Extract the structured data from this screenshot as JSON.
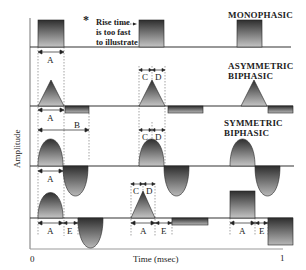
{
  "figure": {
    "waveform_labels": {
      "monophasic": "MONOPHASIC",
      "asymmetric_biphasic_line1": "ASYMMETRIC",
      "asymmetric_biphasic_line2": "BIPHASIC",
      "symmetric_biphasic_line1": "SYMMETRIC",
      "symmetric_biphasic_line2": "BIPHASIC"
    },
    "note": {
      "symbol": "*",
      "line1": "Rise time",
      "line2": "is too fast",
      "line3": "to illustrate"
    },
    "axes": {
      "ylabel": "Amplitude",
      "xlabel": "Time (msec)",
      "x_start": "0",
      "x_end": "1"
    },
    "interval_labels": {
      "A": "A",
      "B": "B",
      "C": "C",
      "D": "D",
      "E": "E"
    },
    "colors": {
      "waveform_dark": "#333333",
      "waveform_light": "#bbbbbb",
      "axis": "#555555"
    }
  }
}
